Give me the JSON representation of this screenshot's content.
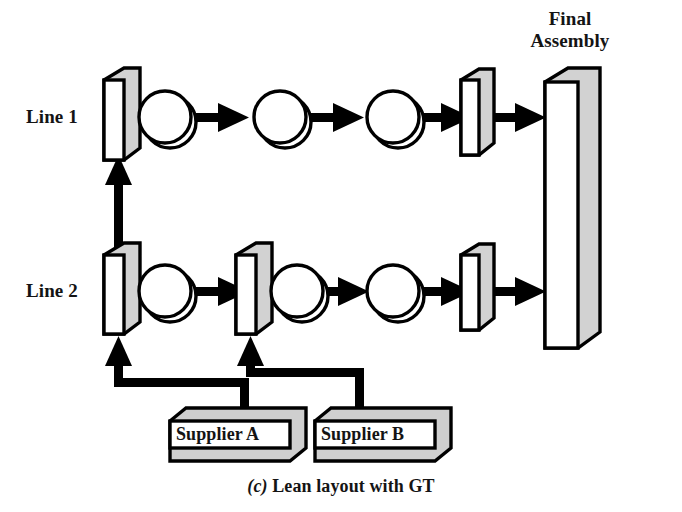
{
  "figure": {
    "caption_prefix": "(c)",
    "caption_text": " Lean layout with GT",
    "caption_full": "(c) Lean layout with GT"
  },
  "labels": {
    "line1": "Line 1",
    "line2": "Line 2",
    "final_assembly_l1": "Final",
    "final_assembly_l2": "Assembly",
    "final_assembly": "Final Assembly",
    "supplier_a": "Supplier A",
    "supplier_b": "Supplier B"
  },
  "colors": {
    "outline": "#000000",
    "face_front": "#ffffff",
    "face_side": "#d2d2d2",
    "face_bottom": "#c9c9c9",
    "arrow": "#000000",
    "text": "#141414",
    "background": "#ffffff"
  },
  "lines": [
    {
      "name": "Line 1",
      "label": "Line 1",
      "stations": [
        {
          "type": "slab",
          "role": "input-buffer"
        },
        {
          "type": "circle",
          "role": "machine"
        },
        {
          "type": "circle",
          "role": "machine"
        },
        {
          "type": "circle",
          "role": "machine"
        },
        {
          "type": "slab",
          "role": "output-buffer"
        }
      ],
      "arrows": 4
    },
    {
      "name": "Line 2",
      "label": "Line 2",
      "stations": [
        {
          "type": "slab",
          "role": "input-buffer"
        },
        {
          "type": "circle",
          "role": "machine"
        },
        {
          "type": "slab",
          "role": "mid-buffer"
        },
        {
          "type": "circle",
          "role": "machine"
        },
        {
          "type": "circle",
          "role": "machine"
        },
        {
          "type": "slab",
          "role": "output-buffer"
        }
      ],
      "arrows": 4
    }
  ],
  "final_assembly": {
    "label": "Final Assembly",
    "inputs": [
      "Line 1",
      "Line 2"
    ]
  },
  "suppliers": [
    {
      "label": "Supplier A",
      "feeds": "Line 2 input buffer"
    },
    {
      "label": "Supplier B",
      "feeds": "Line 2 mid buffer"
    }
  ],
  "connections": [
    {
      "from": "Line 2 input buffer",
      "to": "Line 1 input buffer",
      "direction": "up"
    },
    {
      "from": "Supplier A",
      "to": "Line 2 input buffer",
      "direction": "up-left"
    },
    {
      "from": "Supplier B",
      "to": "Line 2 mid buffer",
      "direction": "up-left"
    }
  ]
}
